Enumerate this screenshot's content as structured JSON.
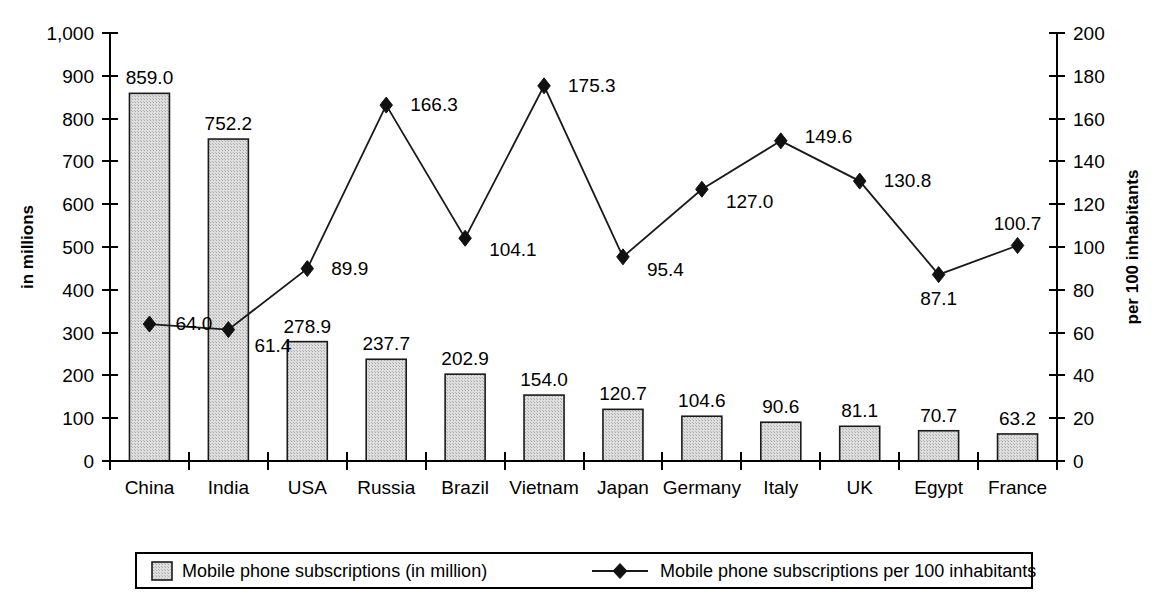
{
  "chart_data": {
    "type": "bar",
    "title": "",
    "subtitle": "",
    "categories": [
      "China",
      "India",
      "USA",
      "Russia",
      "Brazil",
      "Vietnam",
      "Japan",
      "Germany",
      "Italy",
      "UK",
      "Egypt",
      "France"
    ],
    "series": [
      {
        "name": "Mobile phone subscriptions (in million)",
        "type": "bar",
        "axis": "left",
        "values": [
          859.0,
          752.2,
          278.9,
          237.7,
          202.9,
          154.0,
          120.7,
          104.6,
          90.6,
          81.1,
          70.7,
          63.2
        ],
        "labels": [
          "859.0",
          "752.2",
          "278.9",
          "237.7",
          "202.9",
          "154.0",
          "120.7",
          "104.6",
          "90.6",
          "81.1",
          "70.7",
          "63.2"
        ],
        "fill_color": "#d0d0d0",
        "border_color": "#1a1a1a"
      },
      {
        "name": "Mobile phone subscriptions per 100 inhabitants",
        "type": "line",
        "axis": "right",
        "marker": "diamond",
        "values": [
          64.0,
          61.4,
          89.9,
          166.3,
          104.1,
          175.3,
          95.4,
          127.0,
          149.6,
          130.8,
          87.1,
          100.7
        ],
        "labels": [
          "64.0",
          "61.4",
          "89.9",
          "166.3",
          "104.1",
          "175.3",
          "95.4",
          "127.0",
          "149.6",
          "130.8",
          "87.1",
          "100.7"
        ],
        "line_color": "#1a1a1a",
        "marker_color": "#111111"
      }
    ],
    "left_axis": {
      "label": "in millions",
      "ticks": [
        "0",
        "100",
        "200",
        "300",
        "400",
        "500",
        "600",
        "700",
        "800",
        "900",
        "1,000"
      ],
      "tick_values": [
        0,
        100,
        200,
        300,
        400,
        500,
        600,
        700,
        800,
        900,
        1000
      ],
      "min": 0,
      "max": 1000
    },
    "right_axis": {
      "label": "per 100 inhabitants",
      "ticks": [
        "0",
        "20",
        "40",
        "60",
        "80",
        "100",
        "120",
        "140",
        "160",
        "180",
        "200"
      ],
      "tick_values": [
        0,
        20,
        40,
        60,
        80,
        100,
        120,
        140,
        160,
        180,
        200
      ],
      "min": 0,
      "max": 200
    },
    "xlabel": "",
    "grid": false,
    "legend": {
      "position": "bottom",
      "entries": [
        {
          "label": "Mobile phone subscriptions (in million)",
          "marker": "square-swatch"
        },
        {
          "label": "Mobile phone subscriptions per 100 inhabitants",
          "marker": "line-diamond"
        }
      ]
    }
  }
}
